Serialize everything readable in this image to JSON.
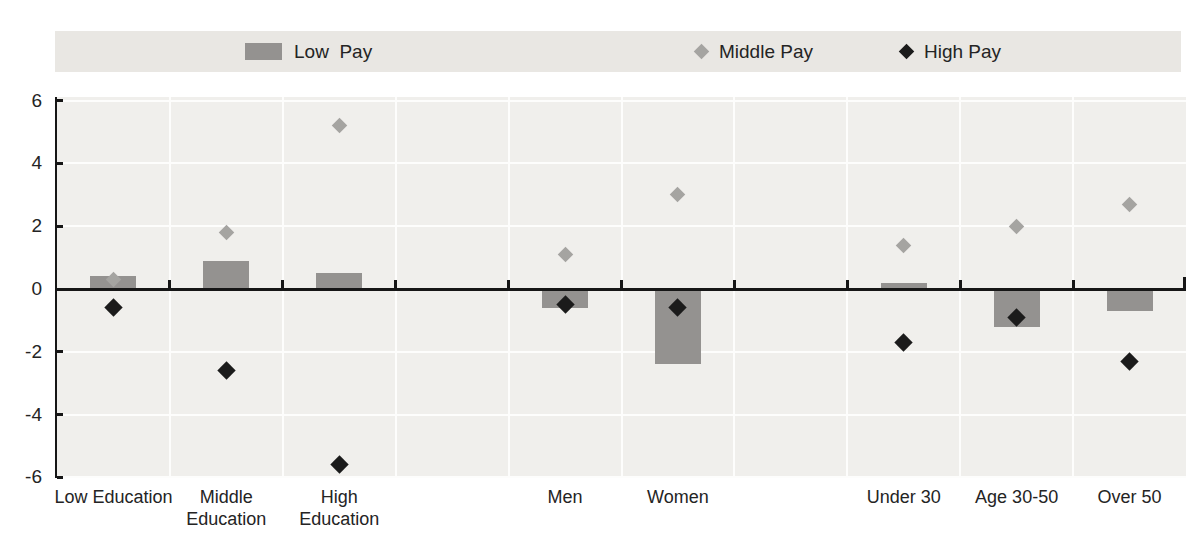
{
  "legend": {
    "background": "#e9e7e3",
    "items": [
      {
        "label": "Low  Pay",
        "marker": "bar-swatch",
        "color": "#949290",
        "left": 190
      },
      {
        "label": "Middle Pay",
        "marker": "diamond",
        "color": "#a5a4a1",
        "left": 641
      },
      {
        "label": "High Pay",
        "marker": "diamond",
        "color": "#1b1b1b",
        "left": 846
      }
    ]
  },
  "axis": {
    "y_tick_labels": [
      "6",
      "4",
      "2",
      "0",
      "-2",
      "-4",
      "-6"
    ],
    "y_tick_values": [
      6,
      4,
      2,
      0,
      -2,
      -4,
      -6
    ]
  },
  "chart_data": {
    "type": "bar",
    "subtype": "bar-with-diamond-markers",
    "title": "",
    "xlabel": "",
    "ylabel": "",
    "ylim": [
      -6,
      6
    ],
    "yticks": [
      6,
      4,
      2,
      0,
      -2,
      -4,
      -6
    ],
    "grid": true,
    "legend_position": "top",
    "categories": [
      "Low Education",
      "Middle Education",
      "High Education",
      "Men",
      "Women",
      "Under 30",
      "Age 30-50",
      "Over 50"
    ],
    "category_label_lines": [
      [
        "Low Education"
      ],
      [
        "Middle",
        "Education"
      ],
      [
        "High",
        "Education"
      ],
      [
        "Men"
      ],
      [
        "Women"
      ],
      [
        "Under 30"
      ],
      [
        "Age 30-50"
      ],
      [
        "Over 50"
      ]
    ],
    "slot_layout": [
      0,
      1,
      2,
      null,
      3,
      4,
      null,
      5,
      6,
      7
    ],
    "series": [
      {
        "name": "Low  Pay",
        "style": "bar",
        "color": "#949290",
        "values": [
          0.4,
          0.9,
          0.5,
          -0.6,
          -2.4,
          0.2,
          -1.2,
          -0.7
        ]
      },
      {
        "name": "Middle Pay",
        "style": "diamond",
        "color": "#a5a4a1",
        "values": [
          0.3,
          1.8,
          5.2,
          1.1,
          3.0,
          1.4,
          2.0,
          2.7
        ]
      },
      {
        "name": "High Pay",
        "style": "diamond",
        "color": "#1b1b1b",
        "values": [
          -0.6,
          -2.6,
          -5.6,
          -0.5,
          -0.6,
          -1.7,
          -0.9,
          -2.3
        ]
      }
    ]
  },
  "colors": {
    "plot_background": "#f0efec",
    "gridline": "#fdfdfc",
    "axis": "#161616",
    "text": "#242424"
  }
}
